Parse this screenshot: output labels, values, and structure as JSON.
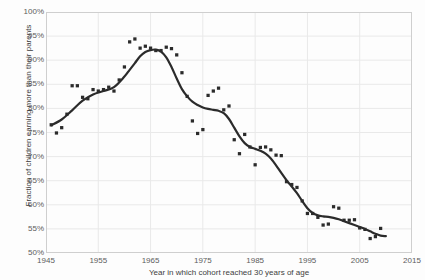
{
  "figure": {
    "ghost_title": "",
    "background_color": "#fdfdfd",
    "plot_border_color": "#cfcfcf",
    "grid_color": "#e9e9e9",
    "ink_color": "#2b2b2b"
  },
  "chart_data": {
    "type": "scatter",
    "title": "",
    "subtitle": "",
    "xlabel": "Year in which cohort reached 30 years of age",
    "ylabel": "Fraction of children earning more than their parents",
    "xlim": [
      1945,
      2015
    ],
    "ylim": [
      50,
      100
    ],
    "xticks": [
      1945,
      1955,
      1965,
      1975,
      1985,
      1995,
      2005,
      2015
    ],
    "xtick_labels": [
      "1945",
      "1955",
      "1965",
      "1975",
      "1985",
      "1995",
      "2005",
      "2015"
    ],
    "yticks": [
      50,
      55,
      60,
      65,
      70,
      75,
      80,
      85,
      90,
      95,
      100
    ],
    "ytick_labels": [
      "50%",
      "55%",
      "60%",
      "65%",
      "70%",
      "75%",
      "80%",
      "85%",
      "90%",
      "95%",
      "100%"
    ],
    "grid": true,
    "grid_axis": "both",
    "legend": null,
    "annotations": [],
    "marker_color": "#2b2b2b",
    "marker_size": 2.1,
    "line_color": "#2b2b2b",
    "line_width": 2.2,
    "series": [
      {
        "name": "Absolute income mobility by birth cohort",
        "type": "scatter",
        "points": [
          [
            1946,
            76.6
          ],
          [
            1947,
            74.9
          ],
          [
            1948,
            76.0
          ],
          [
            1949,
            78.8
          ],
          [
            1950,
            84.7
          ],
          [
            1951,
            84.7
          ],
          [
            1952,
            82.3
          ],
          [
            1953,
            82.0
          ],
          [
            1954,
            83.9
          ],
          [
            1955,
            83.6
          ],
          [
            1956,
            83.9
          ],
          [
            1957,
            84.4
          ],
          [
            1958,
            83.6
          ],
          [
            1959,
            85.9
          ],
          [
            1960,
            88.6
          ],
          [
            1961,
            93.8
          ],
          [
            1962,
            94.4
          ],
          [
            1963,
            92.5
          ],
          [
            1964,
            92.9
          ],
          [
            1965,
            92.5
          ],
          [
            1966,
            92.0
          ],
          [
            1967,
            92.0
          ],
          [
            1968,
            92.7
          ],
          [
            1969,
            92.4
          ],
          [
            1970,
            91.1
          ],
          [
            1971,
            87.4
          ],
          [
            1972,
            82.5
          ],
          [
            1973,
            77.4
          ],
          [
            1974,
            74.8
          ],
          [
            1975,
            75.6
          ],
          [
            1976,
            82.7
          ],
          [
            1977,
            83.6
          ],
          [
            1978,
            84.2
          ],
          [
            1979,
            79.7
          ],
          [
            1980,
            80.5
          ],
          [
            1981,
            73.5
          ],
          [
            1982,
            70.6
          ],
          [
            1983,
            74.6
          ],
          [
            1984,
            72.0
          ],
          [
            1985,
            68.3
          ],
          [
            1986,
            71.9
          ],
          [
            1987,
            72.0
          ],
          [
            1988,
            71.4
          ],
          [
            1989,
            70.3
          ],
          [
            1990,
            70.2
          ],
          [
            1991,
            64.8
          ],
          [
            1992,
            64.2
          ],
          [
            1993,
            63.6
          ],
          [
            1994,
            60.8
          ],
          [
            1995,
            58.2
          ],
          [
            1996,
            58.2
          ],
          [
            1997,
            57.4
          ],
          [
            1998,
            55.8
          ],
          [
            1999,
            56.0
          ],
          [
            2000,
            59.6
          ],
          [
            2001,
            59.3
          ],
          [
            2002,
            56.8
          ],
          [
            2003,
            56.8
          ],
          [
            2004,
            56.9
          ],
          [
            2005,
            55.2
          ],
          [
            2006,
            54.9
          ],
          [
            2007,
            53.0
          ],
          [
            2008,
            53.4
          ],
          [
            2009,
            55.1
          ]
        ],
        "trend_line": [
          [
            1946,
            76.5
          ],
          [
            1948,
            77.7
          ],
          [
            1950,
            79.6
          ],
          [
            1952,
            81.6
          ],
          [
            1954,
            82.9
          ],
          [
            1956,
            83.6
          ],
          [
            1958,
            84.4
          ],
          [
            1960,
            86.6
          ],
          [
            1961,
            88.0
          ],
          [
            1962,
            89.4
          ],
          [
            1963,
            90.8
          ],
          [
            1964,
            91.7
          ],
          [
            1965,
            92.1
          ],
          [
            1966,
            92.2
          ],
          [
            1967,
            91.8
          ],
          [
            1968,
            90.6
          ],
          [
            1969,
            88.6
          ],
          [
            1970,
            86.2
          ],
          [
            1971,
            84.0
          ],
          [
            1972,
            82.5
          ],
          [
            1973,
            81.4
          ],
          [
            1974,
            80.7
          ],
          [
            1975,
            80.2
          ],
          [
            1976,
            79.9
          ],
          [
            1977,
            79.7
          ],
          [
            1978,
            79.5
          ],
          [
            1979,
            79.0
          ],
          [
            1980,
            77.8
          ],
          [
            1981,
            76.0
          ],
          [
            1982,
            74.2
          ],
          [
            1983,
            72.8
          ],
          [
            1984,
            72.0
          ],
          [
            1985,
            71.6
          ],
          [
            1986,
            71.2
          ],
          [
            1987,
            70.6
          ],
          [
            1988,
            69.6
          ],
          [
            1989,
            68.2
          ],
          [
            1990,
            66.6
          ],
          [
            1991,
            65.1
          ],
          [
            1992,
            63.8
          ],
          [
            1993,
            62.4
          ],
          [
            1994,
            60.8
          ],
          [
            1995,
            59.3
          ],
          [
            1996,
            58.3
          ],
          [
            1997,
            57.8
          ],
          [
            1998,
            57.6
          ],
          [
            1999,
            57.5
          ],
          [
            2000,
            57.3
          ],
          [
            2001,
            57.0
          ],
          [
            2002,
            56.6
          ],
          [
            2003,
            56.2
          ],
          [
            2004,
            55.8
          ],
          [
            2005,
            55.4
          ],
          [
            2006,
            55.0
          ],
          [
            2007,
            54.5
          ],
          [
            2008,
            54.0
          ],
          [
            2009,
            53.6
          ],
          [
            2010,
            53.5
          ]
        ]
      }
    ]
  }
}
